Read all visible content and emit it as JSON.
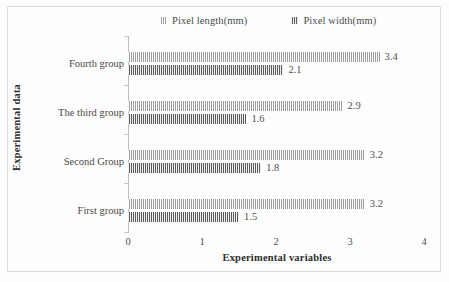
{
  "chart_data": {
    "type": "bar",
    "orientation": "horizontal",
    "title": "",
    "xlabel": "Experimental variables",
    "ylabel": "Experimental data",
    "categories": [
      "Fourth group",
      "The third group",
      "Second Group",
      "First group"
    ],
    "series": [
      {
        "name": "Pixel length(mm)",
        "values": [
          3.4,
          2.9,
          3.2,
          3.2
        ],
        "color": "#c9c9c9",
        "pattern": "vertical-stripes-light"
      },
      {
        "name": "Pixel width(mm)",
        "values": [
          2.1,
          1.6,
          1.8,
          1.5
        ],
        "color": "#9a9a9a",
        "pattern": "vertical-stripes-dark"
      }
    ],
    "xlim": [
      0,
      4
    ],
    "xticks": [
      0,
      1,
      2,
      3,
      4
    ],
    "xtick_labels": [
      "0",
      "1",
      "2",
      "3",
      "4"
    ],
    "grid": false,
    "legend_position": "top"
  },
  "legend": {
    "items": [
      {
        "label": "Pixel length(mm)"
      },
      {
        "label": "Pixel width(mm)"
      }
    ]
  },
  "axes": {
    "x_title": "Experimental variables",
    "y_title": "Experimental data",
    "x_tick_labels": [
      "0",
      "1",
      "2",
      "3",
      "4"
    ]
  },
  "groups": [
    {
      "label": "Fourth group",
      "length": "3.4",
      "width": "2.1"
    },
    {
      "label": "The third group",
      "length": "2.9",
      "width": "1.6"
    },
    {
      "label": "Second Group",
      "length": "3.2",
      "width": "1.8"
    },
    {
      "label": "First group",
      "length": "3.2",
      "width": "1.5"
    }
  ]
}
